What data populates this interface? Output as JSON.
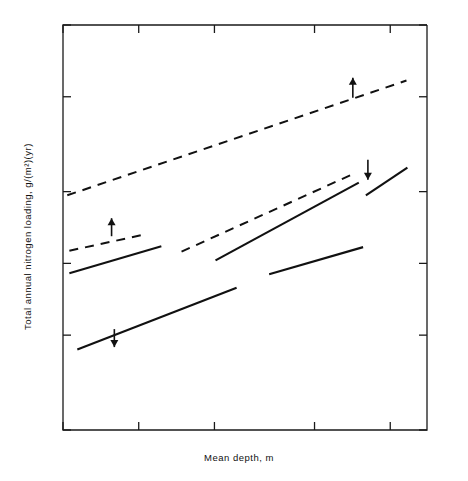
{
  "chart_data": {
    "type": "scatter",
    "title": "",
    "xlabel": "Mean depth, m",
    "ylabel": "Total annual nitrogen loading, g/(m²)(yr)",
    "xscale": "log",
    "yscale": "log",
    "xlim": [
      0.5,
      14.0
    ],
    "ylim": [
      0.2,
      10.0
    ],
    "grid": false,
    "legend_position": "inline-annotations",
    "xticks": [
      {
        "value": 0.5,
        "label": "0.5"
      },
      {
        "value": 1.0,
        "label": "1.0"
      },
      {
        "value": 2.0,
        "label": "2.0"
      },
      {
        "value": 5.0,
        "label": "5.0"
      },
      {
        "value": 10.0,
        "label": "10.0"
      }
    ],
    "yticks": [
      {
        "value": 10.0,
        "label": "10.0"
      },
      {
        "value": 5.0,
        "label": "5.0"
      },
      {
        "value": 2.0,
        "label": "2.0"
      },
      {
        "value": 1.0,
        "label": "1.0"
      },
      {
        "value": 0.5,
        "label": "0.5"
      },
      {
        "value": 0.2,
        "label": "0.2"
      }
    ],
    "point_label_legend": [
      {
        "code": "HE",
        "meaning": "hypereutrophic"
      },
      {
        "code": "E",
        "meaning": "eutrophic"
      },
      {
        "code": "M",
        "meaning": "mesotrophic"
      },
      {
        "code": "O",
        "meaning": "oligotrophic"
      },
      {
        "code": "UO",
        "meaning": "ultraoligotrophic"
      }
    ],
    "points": [
      {
        "label": "HE",
        "x": 0.93,
        "y": 9.0
      },
      {
        "label": "HE",
        "x": 1.18,
        "y": 9.0
      },
      {
        "label": "HE",
        "x": 2.21,
        "y": 9.5
      },
      {
        "label": "HE",
        "x": 3.35,
        "y": 9.4
      },
      {
        "label": "HE",
        "x": 4.05,
        "y": 9.55
      },
      {
        "label": "O",
        "x": 4.05,
        "y": 8.7
      },
      {
        "label": "M",
        "x": 2.92,
        "y": 8.5
      },
      {
        "label": "M",
        "x": 5.1,
        "y": 8.5
      },
      {
        "label": "HE",
        "x": 2.55,
        "y": 8.1
      },
      {
        "label": "O",
        "x": 4.28,
        "y": 7.9
      },
      {
        "label": "O",
        "x": 3.85,
        "y": 7.7
      },
      {
        "label": "O",
        "x": 1.75,
        "y": 7.05
      },
      {
        "label": "E",
        "x": 2.48,
        "y": 7.05
      },
      {
        "label": "O",
        "x": 2.92,
        "y": 7.05
      },
      {
        "label": "HE",
        "x": 4.4,
        "y": 6.55
      },
      {
        "label": "UO",
        "x": 2.82,
        "y": 6.1
      },
      {
        "label": "E",
        "x": 3.25,
        "y": 5.4
      },
      {
        "label": "O",
        "x": 2.12,
        "y": 5.05
      },
      {
        "label": "E",
        "x": 3.95,
        "y": 5.0
      },
      {
        "label": "E",
        "x": 2.35,
        "y": 4.1
      },
      {
        "label": "M",
        "x": 2.18,
        "y": 3.75
      },
      {
        "label": "M",
        "x": 2.55,
        "y": 3.75
      },
      {
        "label": "M",
        "x": 3.1,
        "y": 3.62
      },
      {
        "label": "HE",
        "x": 2.12,
        "y": 3.5
      },
      {
        "label": "M",
        "x": 4.35,
        "y": 3.6
      },
      {
        "label": "O",
        "x": 4.05,
        "y": 3.1
      },
      {
        "label": "E",
        "x": 3.68,
        "y": 3.45
      },
      {
        "label": "M",
        "x": 3.55,
        "y": 2.82
      },
      {
        "label": "UO",
        "x": 3.22,
        "y": 2.58
      },
      {
        "label": "UO",
        "x": 3.95,
        "y": 2.58
      },
      {
        "label": "M",
        "x": 4.35,
        "y": 2.5
      },
      {
        "label": "E",
        "x": 4.1,
        "y": 2.18
      },
      {
        "label": "O",
        "x": 1.1,
        "y": 2.05
      },
      {
        "label": "M",
        "x": 1.45,
        "y": 1.95
      },
      {
        "label": "UO",
        "x": 1.72,
        "y": 1.9
      },
      {
        "label": "O",
        "x": 2.55,
        "y": 2.0
      },
      {
        "label": "O",
        "x": 2.55,
        "y": 1.82
      },
      {
        "label": "O",
        "x": 4.65,
        "y": 1.72
      },
      {
        "label": "O",
        "x": 5.3,
        "y": 1.62
      },
      {
        "label": "O",
        "x": 2.52,
        "y": 1.5
      },
      {
        "label": "O",
        "x": 4.45,
        "y": 1.42
      },
      {
        "label": "O",
        "x": 5.05,
        "y": 1.41
      },
      {
        "label": "O",
        "x": 5.2,
        "y": 1.28
      },
      {
        "label": "UO",
        "x": 5.55,
        "y": 1.25
      },
      {
        "label": "O",
        "x": 6.2,
        "y": 1.44
      },
      {
        "label": "O",
        "x": 6.25,
        "y": 1.27
      },
      {
        "label": "O",
        "x": 7.4,
        "y": 1.45
      },
      {
        "label": "O",
        "x": 7.2,
        "y": 1.27
      },
      {
        "label": "O",
        "x": 8.4,
        "y": 1.42
      },
      {
        "label": "UO",
        "x": 7.95,
        "y": 1.26
      },
      {
        "label": "UO",
        "x": 9.15,
        "y": 1.45
      },
      {
        "label": "O",
        "x": 5.8,
        "y": 1.14
      },
      {
        "label": "UO",
        "x": 6.45,
        "y": 1.14
      },
      {
        "label": "UO",
        "x": 7.55,
        "y": 1.15
      },
      {
        "label": "UO",
        "x": 9.5,
        "y": 1.16
      },
      {
        "label": "UO",
        "x": 6.0,
        "y": 1.05
      },
      {
        "label": "UO",
        "x": 6.7,
        "y": 1.03
      },
      {
        "label": "UO",
        "x": 8.85,
        "y": 1.05
      }
    ],
    "lines": [
      {
        "name": "eutrophic-florida-line",
        "style": "dashed",
        "x1": 0.52,
        "y1": 1.93,
        "x2": 11.6,
        "y2": 5.85
      },
      {
        "name": "oligotrophic-florida-line",
        "style": "dashed",
        "x1": 1.48,
        "y1": 1.12,
        "x2": 7.3,
        "y2": 2.4
      },
      {
        "name": "oligotrophic-florida-line-solid",
        "style": "solid",
        "x1": 2.02,
        "y1": 1.03,
        "x2": 7.5,
        "y2": 2.18
      },
      {
        "name": "oligotrophic-florida-line-solid-right",
        "style": "solid",
        "x1": 8.0,
        "y1": 1.93,
        "x2": 11.7,
        "y2": 2.52
      },
      {
        "name": "eutrophic-vollenweider-line",
        "style": "solid",
        "x1": 0.53,
        "y1": 0.91,
        "x2": 1.23,
        "y2": 1.18
      },
      {
        "name": "eutrophic-vollenweider-line-dashed",
        "style": "dashed",
        "x1": 0.53,
        "y1": 1.13,
        "x2": 1.05,
        "y2": 1.32
      },
      {
        "name": "oligotrophic-vollenweider-line",
        "style": "solid",
        "x1": 0.57,
        "y1": 0.435,
        "x2": 2.45,
        "y2": 0.79
      },
      {
        "name": "oligotrophic-florida-lower-solid",
        "style": "solid",
        "x1": 3.3,
        "y1": 0.9,
        "x2": 7.8,
        "y2": 1.17
      }
    ],
    "annotations": [
      {
        "name": "eutrophic-florida",
        "lines": [
          "Eutrophic",
          "lakes",
          "(Florida)"
        ],
        "x": 7.1,
        "y": 7.6,
        "arrow": "up"
      },
      {
        "name": "oligotrophic-florida",
        "lines": [
          "Oligotrophic",
          "lakes",
          "(Florida)"
        ],
        "x": 9.3,
        "y": 1.95,
        "arrow": "down"
      },
      {
        "name": "eutrophic-vollenweider",
        "lines": [
          "Eutrophic  lakes",
          "(Vollenweider)"
        ],
        "x": 1.45,
        "y": 1.17,
        "arrow": "up"
      },
      {
        "name": "oligotrophic-vollenweider",
        "lines": [
          "Oligotrophic  lakes",
          "(Vollenweider)"
        ],
        "x": 1.55,
        "y": 0.445,
        "arrow": "down"
      }
    ]
  }
}
